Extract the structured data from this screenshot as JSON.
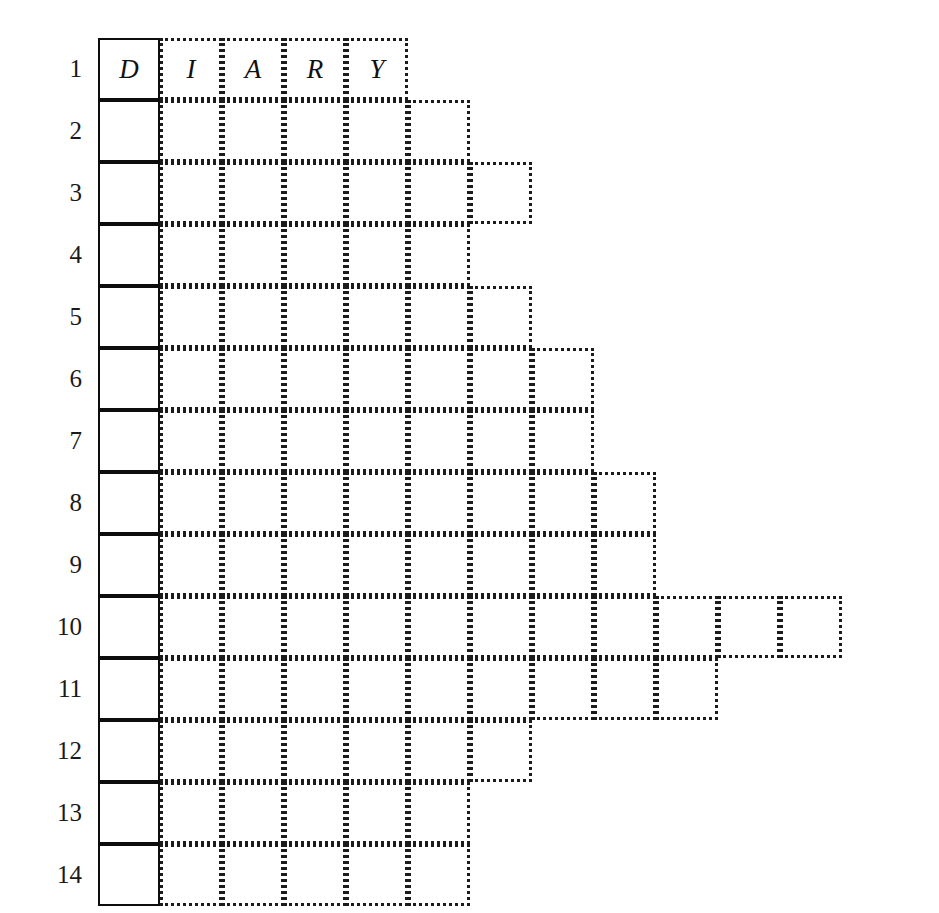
{
  "puzzle": {
    "type": "acrostic-stepped-crossword-grid",
    "row_count": 14,
    "key_column_index": 1,
    "key_word": "DIARY",
    "geometry": {
      "cell_width": 62,
      "cell_height": 62,
      "grid_left": 98,
      "grid_top": 38,
      "number_gutter_right": 82
    },
    "row_numbers": [
      "1",
      "2",
      "3",
      "4",
      "5",
      "6",
      "7",
      "8",
      "9",
      "10",
      "11",
      "12",
      "13",
      "14"
    ],
    "rows": [
      {
        "number": "1",
        "length": 5,
        "letters": [
          "D",
          "I",
          "A",
          "R",
          "Y"
        ]
      },
      {
        "number": "2",
        "length": 6,
        "letters": [
          "",
          "",
          "",
          "",
          "",
          ""
        ]
      },
      {
        "number": "3",
        "length": 7,
        "letters": [
          "",
          "",
          "",
          "",
          "",
          "",
          ""
        ]
      },
      {
        "number": "4",
        "length": 6,
        "letters": [
          "",
          "",
          "",
          "",
          "",
          ""
        ]
      },
      {
        "number": "5",
        "length": 7,
        "letters": [
          "",
          "",
          "",
          "",
          "",
          "",
          ""
        ]
      },
      {
        "number": "6",
        "length": 8,
        "letters": [
          "",
          "",
          "",
          "",
          "",
          "",
          "",
          ""
        ]
      },
      {
        "number": "7",
        "length": 8,
        "letters": [
          "",
          "",
          "",
          "",
          "",
          "",
          "",
          ""
        ]
      },
      {
        "number": "8",
        "length": 9,
        "letters": [
          "",
          "",
          "",
          "",
          "",
          "",
          "",
          "",
          ""
        ]
      },
      {
        "number": "9",
        "length": 9,
        "letters": [
          "",
          "",
          "",
          "",
          "",
          "",
          "",
          "",
          ""
        ]
      },
      {
        "number": "10",
        "length": 12,
        "letters": [
          "",
          "",
          "",
          "",
          "",
          "",
          "",
          "",
          "",
          "",
          "",
          ""
        ]
      },
      {
        "number": "11",
        "length": 10,
        "letters": [
          "",
          "",
          "",
          "",
          "",
          "",
          "",
          "",
          "",
          ""
        ]
      },
      {
        "number": "12",
        "length": 7,
        "letters": [
          "",
          "",
          "",
          "",
          "",
          "",
          ""
        ]
      },
      {
        "number": "13",
        "length": 6,
        "letters": [
          "",
          "",
          "",
          "",
          "",
          ""
        ]
      },
      {
        "number": "14",
        "length": 6,
        "letters": [
          "",
          "",
          "",
          "",
          "",
          ""
        ]
      }
    ],
    "colors": {
      "background": "#ffffff",
      "solid_border": "#0d0d0d",
      "dotted_border": "#1b1b1b",
      "text": "#111111"
    }
  }
}
